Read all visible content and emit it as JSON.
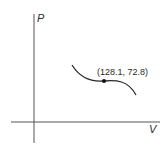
{
  "diagram": {
    "y_axis_label": "P",
    "x_axis_label": "V",
    "point_label": "(128.1, 72.8)",
    "point": {
      "V": 128.1,
      "P": 72.8
    },
    "curve_description": "Decreasing cubic-like P–V curve with inflection at the labeled point",
    "colors": {
      "line": "#2a2a2a",
      "axis": "#555555",
      "background": "#ffffff"
    }
  }
}
